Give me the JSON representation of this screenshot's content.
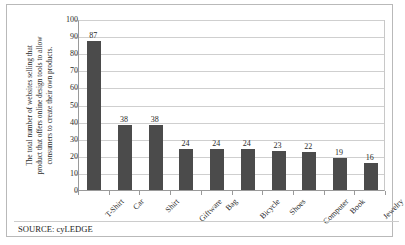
{
  "chart_data": {
    "type": "bar",
    "title": "",
    "subtitle": "",
    "xlabel": "",
    "ylabel": "The total number of websites selling that product that offers online design tools to allow consumers to create their own products.",
    "ylabel_lines": [
      "The total number of websites selling that",
      "product that offers online design tools to allow",
      "consumers to create their own products."
    ],
    "categories": [
      "T-Shirt",
      "Car",
      "Shirt",
      "Giftware",
      "Bag",
      "Bicycle",
      "Shoes",
      "Computer",
      "Book",
      "Jewelry"
    ],
    "values": [
      87,
      38,
      38,
      24,
      24,
      24,
      23,
      22,
      19,
      16
    ],
    "ylim": [
      0,
      100
    ],
    "yticks": [
      0,
      10,
      20,
      30,
      40,
      50,
      60,
      70,
      80,
      90,
      100
    ],
    "ytick_labels": [
      "0",
      "10",
      "20",
      "30",
      "40",
      "50",
      "60",
      "70",
      "80",
      "90",
      "100"
    ],
    "grid": true,
    "grid_axis": "y",
    "legend": false,
    "legend_position": "none",
    "bar_color": "#4b4b4b",
    "data_labels": [
      "87",
      "38",
      "38",
      "24",
      "24",
      "24",
      "23",
      "22",
      "19",
      "16"
    ]
  },
  "footer": {
    "source_text": "SOURCE: cyLEDGE"
  },
  "style": {
    "background": "#ffffff",
    "frame_color": "#b9b9b9",
    "gridline_color": "#cfcfcf",
    "axis_color": "#9a9a9a",
    "text_color": "#2b2b2b"
  }
}
